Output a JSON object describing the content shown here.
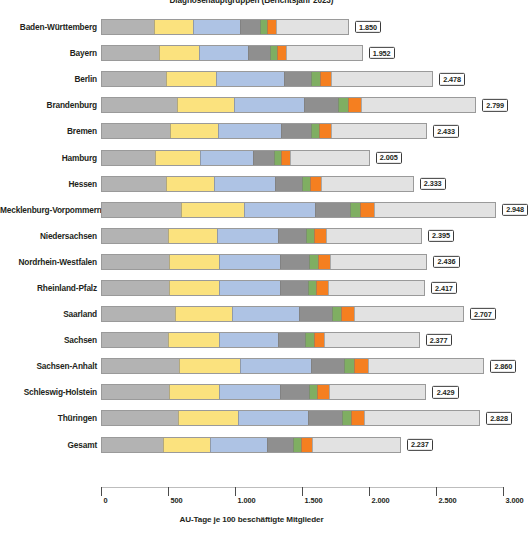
{
  "chart_data": {
    "type": "bar",
    "subtype": "stacked-horizontal",
    "title": "Diagnosehauptgruppen (Berichtsjahr 2023)",
    "xlabel": "AU-Tage je 100 beschäftigte Mitglieder",
    "ylabel": "",
    "xlim": [
      0,
      3000
    ],
    "xticks": [
      0,
      500,
      1000,
      1500,
      2000,
      2500,
      3000
    ],
    "xtick_labels": [
      "0",
      "500",
      "1.000",
      "1.500",
      "2.000",
      "2.500",
      "3.000"
    ],
    "grid": false,
    "legend": "none",
    "value_label_format": "de-DE thousands dot",
    "series": [
      {
        "name": "gruppe-1",
        "color": "#b3b3b3"
      },
      {
        "name": "gruppe-2",
        "color": "#fbe27e"
      },
      {
        "name": "gruppe-3",
        "color": "#aec3e4"
      },
      {
        "name": "gruppe-4",
        "color": "#8f8f8f"
      },
      {
        "name": "gruppe-5",
        "color": "#7fae62"
      },
      {
        "name": "gruppe-6",
        "color": "#f57f20"
      },
      {
        "name": "gruppe-7",
        "color": "#e2e2e2"
      }
    ],
    "categories": [
      "Baden-Württemberg",
      "Bayern",
      "Berlin",
      "Brandenburg",
      "Bremen",
      "Hamburg",
      "Hessen",
      "Mecklenburg-Vorpommern",
      "Niedersachsen",
      "Nordrhein-Westfalen",
      "Rheinland-Pfalz",
      "Saarland",
      "Sachsen",
      "Sachsen-Anhalt",
      "Schleswig-Holstein",
      "Thüringen",
      "Gesamt"
    ],
    "rows": [
      {
        "category": "Baden-Württemberg",
        "total": 1850,
        "total_label": "1.850",
        "segments": [
          390,
          285,
          345,
          150,
          45,
          55,
          580
        ]
      },
      {
        "category": "Bayern",
        "total": 1952,
        "total_label": "1.952",
        "segments": [
          425,
          300,
          355,
          160,
          45,
          62,
          605
        ]
      },
      {
        "category": "Berlin",
        "total": 2478,
        "total_label": "2.478",
        "segments": [
          480,
          370,
          500,
          200,
          55,
          75,
          798
        ]
      },
      {
        "category": "Brandenburg",
        "total": 2799,
        "total_label": "2.799",
        "segments": [
          560,
          425,
          515,
          250,
          65,
          90,
          894
        ]
      },
      {
        "category": "Bremen",
        "total": 2433,
        "total_label": "2.433",
        "segments": [
          510,
          355,
          465,
          215,
          55,
          80,
          753
        ]
      },
      {
        "category": "Hamburg",
        "total": 2005,
        "total_label": "2.005",
        "segments": [
          400,
          330,
          390,
          150,
          45,
          60,
          630
        ]
      },
      {
        "category": "Hessen",
        "total": 2333,
        "total_label": "2.333",
        "segments": [
          480,
          355,
          450,
          195,
          55,
          75,
          723
        ]
      },
      {
        "category": "Mecklenburg-Vorpommern",
        "total": 2948,
        "total_label": "2.948",
        "segments": [
          595,
          460,
          530,
          255,
          65,
          95,
          948
        ]
      },
      {
        "category": "Niedersachsen",
        "total": 2395,
        "total_label": "2.395",
        "segments": [
          495,
          360,
          450,
          205,
          55,
          78,
          752
        ]
      },
      {
        "category": "Nordrhein-Westfalen",
        "total": 2436,
        "total_label": "2.436",
        "segments": [
          505,
          365,
          455,
          210,
          58,
          80,
          763
        ]
      },
      {
        "category": "Rheinland-Pfalz",
        "total": 2417,
        "total_label": "2.417",
        "segments": [
          500,
          370,
          450,
          205,
          55,
          80,
          757
        ]
      },
      {
        "category": "Saarland",
        "total": 2707,
        "total_label": "2.707",
        "segments": [
          545,
          420,
          500,
          235,
          62,
          88,
          857
        ]
      },
      {
        "category": "Sachsen",
        "total": 2377,
        "total_label": "2.377",
        "segments": [
          495,
          375,
          440,
          195,
          55,
          72,
          745
        ]
      },
      {
        "category": "Sachsen-Anhalt",
        "total": 2860,
        "total_label": "2.860",
        "segments": [
          580,
          450,
          520,
          245,
          65,
          95,
          905
        ]
      },
      {
        "category": "Schleswig-Holstein",
        "total": 2429,
        "total_label": "2.429",
        "segments": [
          505,
          365,
          455,
          205,
          58,
          80,
          761
        ]
      },
      {
        "category": "Thüringen",
        "total": 2828,
        "total_label": "2.828",
        "segments": [
          570,
          445,
          515,
          245,
          65,
          92,
          896
        ]
      },
      {
        "category": "Gesamt",
        "total": 2237,
        "total_label": "2.237",
        "segments": [
          460,
          345,
          420,
          190,
          52,
          70,
          700
        ]
      }
    ]
  }
}
